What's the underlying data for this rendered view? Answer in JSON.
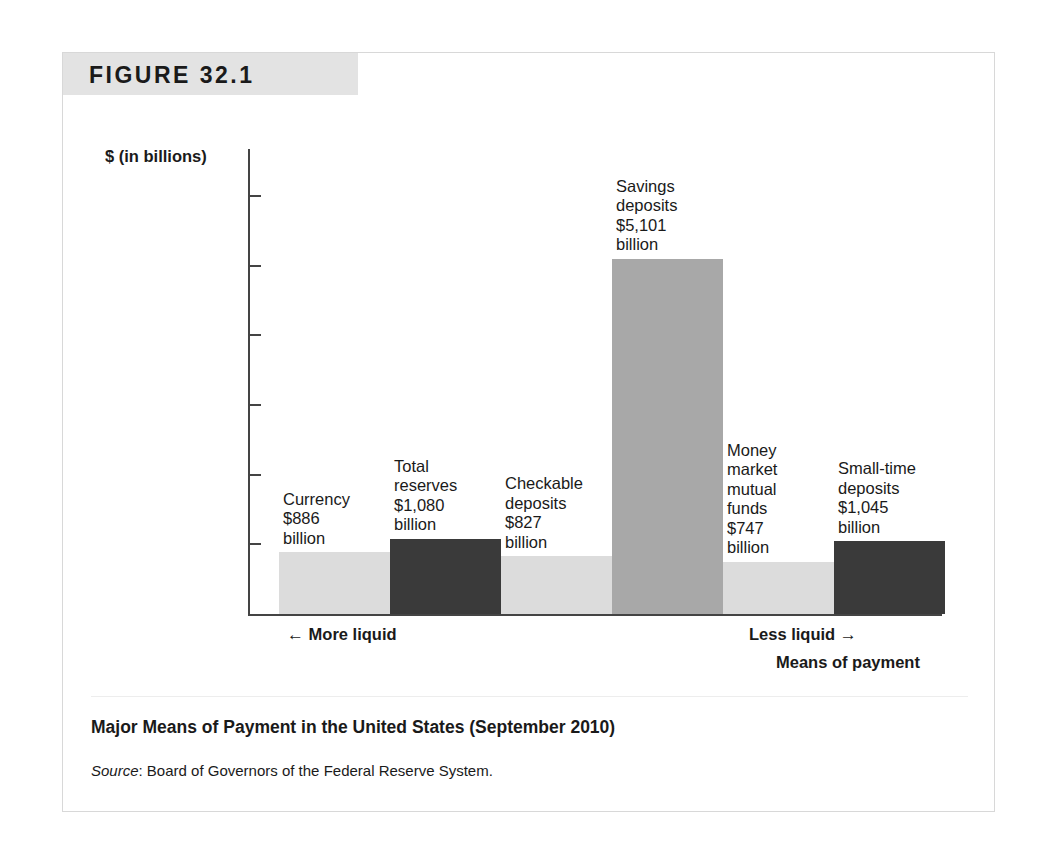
{
  "figure": {
    "banner_label": "FIGURE 32.1",
    "caption_title": "Major Means of Payment in the United States (September 2010)",
    "source_word": "Source",
    "source_text": ": Board of Governors of the Federal Reserve System."
  },
  "axis": {
    "y_title": "$ (in billions)",
    "y_ticks": [
      "$6,000",
      "$5,000",
      "$4,000",
      "$3,000",
      "$2,000",
      "$1,000",
      "0"
    ],
    "more_liquid_arrow": "←",
    "more_liquid_label": "More liquid",
    "less_liquid_label": "Less liquid",
    "less_liquid_arrow": "→",
    "x_title": "Means of payment"
  },
  "colors": {
    "bar_light": "#dcdcdc",
    "bar_medium": "#a8a8a8",
    "bar_dark": "#3a3a3a",
    "banner_bg": "#e3e3e3",
    "frame_border": "#d8d8d8",
    "axis": "#444444"
  },
  "chart_data": {
    "type": "bar",
    "title": "Major Means of Payment in the United States (September 2010)",
    "xlabel": "Means of payment",
    "ylabel": "$ (in billions)",
    "ylim": [
      0,
      6000
    ],
    "grid": false,
    "legend": "none",
    "source": "Board of Governors of the Federal Reserve System.",
    "categories": [
      "Currency",
      "Total reserves",
      "Checkable deposits",
      "Savings deposits",
      "Money market mutual funds",
      "Small-time deposits"
    ],
    "values": [
      886,
      1080,
      827,
      5101,
      747,
      1045
    ],
    "bars": [
      {
        "name": "Currency",
        "value": 886,
        "value_text": "$886",
        "unit_text": "billion",
        "label_lines": [
          "Currency",
          "$886",
          "billion"
        ],
        "shade": "light"
      },
      {
        "name": "Total reserves",
        "value": 1080,
        "value_text": "$1,080",
        "unit_text": "billion",
        "label_lines": [
          "Total",
          "reserves",
          "$1,080",
          "billion"
        ],
        "shade": "dark"
      },
      {
        "name": "Checkable deposits",
        "value": 827,
        "value_text": "$827",
        "unit_text": "billion",
        "label_lines": [
          "Checkable",
          "deposits",
          "$827",
          "billion"
        ],
        "shade": "light"
      },
      {
        "name": "Savings deposits",
        "value": 5101,
        "value_text": "$5,101",
        "unit_text": "billion",
        "label_lines": [
          "Savings",
          "deposits",
          "$5,101",
          "billion"
        ],
        "shade": "medium"
      },
      {
        "name": "Money market mutual funds",
        "value": 747,
        "value_text": "$747",
        "unit_text": "billion",
        "label_lines": [
          "Money",
          "market",
          "mutual",
          "funds",
          "$747",
          "billion"
        ],
        "shade": "light"
      },
      {
        "name": "Small-time deposits",
        "value": 1045,
        "value_text": "$1,045",
        "unit_text": "billion",
        "label_lines": [
          "Small-time",
          "deposits",
          "$1,045",
          "billion"
        ],
        "shade": "dark"
      }
    ]
  }
}
